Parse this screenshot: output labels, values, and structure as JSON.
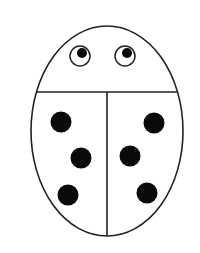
{
  "figure": {
    "subject": "ladybug line drawing",
    "colors": {
      "background": "#ffffff",
      "outline": "#222222",
      "spot": "#0a0a0a"
    },
    "body": {
      "cx": 107,
      "cy": 131,
      "rx": 76,
      "ry": 105
    },
    "head_divider_y": 92,
    "center_line": {
      "x": 107,
      "y1": 92,
      "y2": 236
    },
    "eyes": [
      {
        "side": "left",
        "cx": 80,
        "cy": 56,
        "r": 10,
        "pupil_cx": 82,
        "pupil_cy": 53,
        "pupil_r": 5
      },
      {
        "side": "right",
        "cx": 125,
        "cy": 56,
        "r": 10,
        "pupil_cx": 127,
        "pupil_cy": 53,
        "pupil_r": 5
      }
    ],
    "spots": [
      {
        "cx": 61,
        "cy": 122,
        "r": 10.5
      },
      {
        "cx": 81,
        "cy": 158,
        "r": 10.5
      },
      {
        "cx": 68,
        "cy": 195,
        "r": 10.5
      },
      {
        "cx": 154,
        "cy": 123,
        "r": 10.5
      },
      {
        "cx": 130,
        "cy": 156,
        "r": 10.5
      },
      {
        "cx": 147,
        "cy": 193,
        "r": 10.5
      }
    ],
    "spot_count": 6
  }
}
